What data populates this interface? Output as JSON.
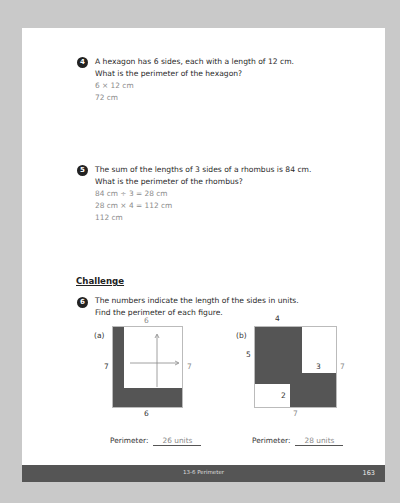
{
  "questions": [
    {
      "number": "4",
      "lines": [
        "A hexagon has 6 sides, each with a length of 12 cm.",
        "What is the perimeter of the hexagon?"
      ],
      "answers": [
        "6 × 12 cm",
        "72 cm"
      ]
    },
    {
      "number": "5",
      "lines": [
        "The sum of the lengths of 3 sides of a rhombus is 84 cm.",
        "What is the perimeter of the rhombus?"
      ],
      "answers": [
        "84 cm ÷ 3 = 28 cm",
        "28 cm × 4 = 112 cm",
        "112 cm"
      ]
    }
  ],
  "challenge": {
    "heading": "Challenge",
    "number": "6",
    "lines": [
      "The numbers indicate the length of the sides in units.",
      "Find the perimeter of each figure."
    ],
    "figure_a": {
      "label": "(a)",
      "top": "6",
      "left": "7",
      "right": "7",
      "bottom": "6",
      "perimeter_label": "Perimeter:",
      "perimeter_value": "26 units"
    },
    "figure_b": {
      "label": "(b)",
      "top": "4",
      "left": "5",
      "inner_right": "3",
      "right": "7",
      "inner_bottom": "2",
      "bottom": "7",
      "perimeter_label": "Perimeter:",
      "perimeter_value": "28 units"
    }
  },
  "footer": {
    "title": "13-6  Perimeter",
    "page_number": "163"
  },
  "colors": {
    "background": "#c9c9c9",
    "page": "#ffffff",
    "footer_bar": "#555555",
    "shaded": "#555555",
    "answer_text": "#8a8a8a"
  }
}
